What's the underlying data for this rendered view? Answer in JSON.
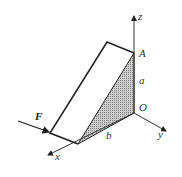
{
  "figure": {
    "labels": {
      "z_axis": "z",
      "y_axis": "y",
      "x_axis": "x",
      "point_A": "A",
      "origin": "O",
      "dimension_a": "a",
      "dimension_b": "b",
      "force": "F"
    },
    "colors": {
      "line": "#222222",
      "shade": "#9a9a9a",
      "background": "#ffffff"
    }
  }
}
